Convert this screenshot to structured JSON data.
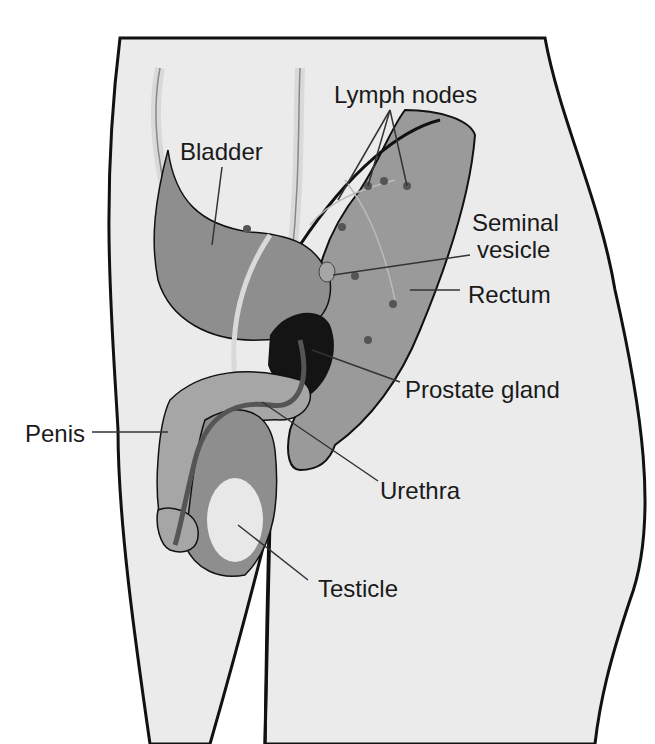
{
  "diagram": {
    "colors": {
      "background": "#ffffff",
      "body": "#ebebeb",
      "organ": "#8e8e8e",
      "organ_light": "#a6a6a6",
      "prostate": "#141414",
      "vessel": "#d9d9d9",
      "outline": "#111111",
      "leader": "#333333",
      "node": "#555555",
      "testicle": "#e8e8e8"
    },
    "labels": {
      "lymph_nodes": "Lymph nodes",
      "bladder": "Bladder",
      "seminal_vesicle_line1": "Seminal",
      "seminal_vesicle_line2": "vesicle",
      "rectum": "Rectum",
      "prostate_gland": "Prostate gland",
      "penis": "Penis",
      "urethra": "Urethra",
      "testicle": "Testicle"
    }
  }
}
